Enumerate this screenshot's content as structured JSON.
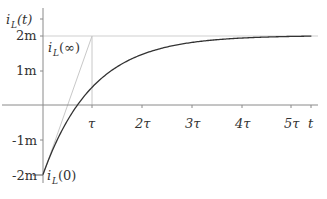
{
  "chart_data": {
    "type": "line",
    "title": "",
    "xlabel": "t",
    "ylabel": "i_L(t)",
    "x_ticks": [
      "τ",
      "2τ",
      "3τ",
      "4τ",
      "5τ"
    ],
    "y_ticks": [
      "2m",
      "1m",
      "-1m",
      "-2m"
    ],
    "y_tick_values": [
      0.002,
      0.001,
      -0.001,
      -0.002
    ],
    "xlim": [
      0,
      5.4
    ],
    "ylim": [
      -0.002,
      0.002
    ],
    "grid": false,
    "legend": null,
    "series": [
      {
        "name": "i_L(t)",
        "formula": "i_L(t) = 2m - 4m·e^(-t/τ)",
        "x": [
          0,
          0.5,
          1,
          1.5,
          2,
          2.5,
          3,
          3.5,
          4,
          4.5,
          5,
          5.4
        ],
        "values": [
          -0.002,
          -0.000426,
          0.000528,
          0.001107,
          0.001459,
          0.001672,
          0.001801,
          0.001879,
          0.001927,
          0.001956,
          0.001973,
          0.001982
        ]
      },
      {
        "name": "initial tangent",
        "x": [
          0,
          1
        ],
        "values": [
          -0.002,
          0.002
        ]
      },
      {
        "name": "final value asymptote",
        "x": [
          0,
          5.4
        ],
        "values": [
          0.002,
          0.002
        ]
      }
    ],
    "annotations": [
      {
        "text": "i_L(∞)",
        "x": 0,
        "y": 0.002
      },
      {
        "text": "i_L(0)",
        "x": 0,
        "y": -0.002
      }
    ]
  },
  "labels": {
    "y_axis_main": "i",
    "y_axis_sub": "L",
    "y_axis_tail": "(t)",
    "x_axis": "t",
    "tau": "τ",
    "two_tau": "2τ",
    "three_tau": "3τ",
    "four_tau": "4τ",
    "five_tau": "5τ",
    "y2m": "2m",
    "y1m": "1m",
    "yneg1m": "-1m",
    "yneg2m": "-2m",
    "inf_main": "i",
    "inf_sub": "L",
    "inf_tail": "(∞)",
    "zero_main": "i",
    "zero_sub": "L",
    "zero_tail": "(0)"
  }
}
